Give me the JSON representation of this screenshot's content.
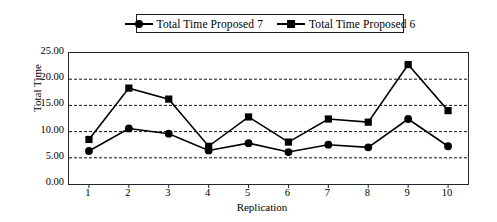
{
  "chart_data": {
    "type": "line",
    "title": "",
    "xlabel": "Replication",
    "ylabel": "Total Time",
    "categories": [
      "1",
      "2",
      "3",
      "4",
      "5",
      "6",
      "7",
      "8",
      "9",
      "10"
    ],
    "ylim": [
      0.0,
      25.0
    ],
    "ytick_step": 5.0,
    "ytick_labels": [
      "0.00",
      "5.00",
      "10.00",
      "15.00",
      "20.00",
      "25.00"
    ],
    "ytick_values": [
      0.0,
      5.0,
      10.0,
      15.0,
      20.0,
      25.0
    ],
    "grid": "horizontal-dashed",
    "legend_position": "top-center",
    "series": [
      {
        "name": "Total Time Proposed 7",
        "marker": "circle",
        "color": "#000000",
        "values": [
          6.3,
          10.6,
          9.6,
          6.4,
          7.8,
          6.1,
          7.5,
          7.0,
          12.4,
          7.2
        ]
      },
      {
        "name": "Total Time Proposed 6",
        "marker": "square",
        "color": "#000000",
        "values": [
          8.5,
          18.3,
          16.2,
          7.2,
          12.8,
          8.0,
          12.4,
          11.8,
          22.8,
          14.0
        ]
      }
    ]
  },
  "legend": {
    "entries": [
      {
        "label": "Total Time Proposed 7",
        "marker": "circle"
      },
      {
        "label": "Total Time Proposed 6",
        "marker": "square"
      }
    ]
  },
  "axes": {
    "y_title": "Total Time",
    "x_title": "Replication"
  }
}
